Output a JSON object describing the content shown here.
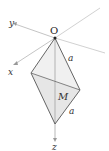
{
  "diagram": {
    "type": "3d-coordinate-geometry",
    "labels": {
      "origin": "O",
      "x_axis": "x",
      "y_axis": "y",
      "z_axis": "z",
      "edge_top": "a",
      "edge_bottom": "a",
      "midpoint": "M"
    },
    "colors": {
      "axis": "#b0b0b0",
      "edge": "#555555",
      "fill": "#eeeeee",
      "text": "#333333"
    }
  }
}
